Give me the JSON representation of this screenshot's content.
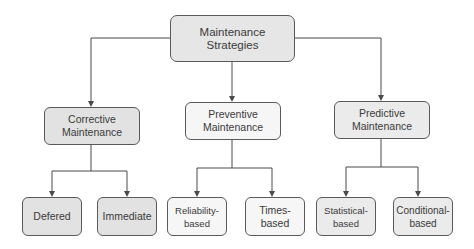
{
  "diagram": {
    "type": "tree",
    "title": "Maintenance Strategies",
    "colors": {
      "line": "#4a4a4a",
      "text": "#3a3a3a",
      "border": "#5a5a5a",
      "fill_dark": "#e2e2e2",
      "fill_mid": "#ebebeb",
      "fill_light": "#f6f6f6"
    },
    "root": {
      "id": "maintenance-strategies",
      "label": "Maintenance Strategies"
    },
    "categories": [
      {
        "id": "corrective",
        "label": "Corrective Maintenance",
        "children": [
          {
            "id": "defered",
            "label": "Defered"
          },
          {
            "id": "immediate",
            "label": "Immediate"
          }
        ]
      },
      {
        "id": "preventive",
        "label": "Preventive Maintenance",
        "children": [
          {
            "id": "reliability-based",
            "label": "Reliability-based"
          },
          {
            "id": "times-based",
            "label": "Times-based"
          }
        ]
      },
      {
        "id": "predictive",
        "label": "Predictive Maintenance",
        "children": [
          {
            "id": "statistical-based",
            "label": "Statistical-based"
          },
          {
            "id": "conditional-based",
            "label": "Conditional-\nbased"
          }
        ]
      }
    ]
  }
}
